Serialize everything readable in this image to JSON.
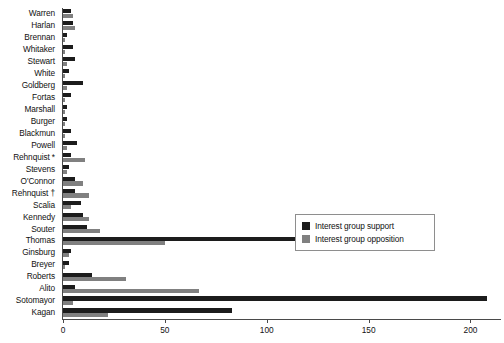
{
  "chart_data": {
    "type": "bar",
    "orientation": "horizontal",
    "title": "",
    "subtitle": "",
    "xlabel": "",
    "ylabel": "",
    "xlim": [
      0,
      215
    ],
    "ylim": null,
    "grid": false,
    "axis_ticks": [
      0,
      50,
      100,
      150,
      200
    ],
    "tick_labels": [
      "0",
      "50",
      "100",
      "150",
      "200"
    ],
    "legend_position": "center-right-inside",
    "categories": [
      "Warren",
      "Harlan",
      "Brennan",
      "Whitaker",
      "Stewart",
      "White",
      "Goldberg",
      "Fortas",
      "Marshall",
      "Burger",
      "Blackmun",
      "Powell",
      "Rehnquist *",
      "Stevens",
      "O'Connor",
      "Rehnquist †",
      "Scalia",
      "Kennedy",
      "Souter",
      "Thomas",
      "Ginsburg",
      "Breyer",
      "Roberts",
      "Alito",
      "Sotomayor",
      "Kagan"
    ],
    "series": [
      {
        "name": "Interest group support",
        "color": "#1c1c1c",
        "values": [
          4,
          5,
          2,
          5,
          6,
          3,
          10,
          4,
          2,
          2,
          4,
          7,
          4,
          3,
          6,
          6,
          9,
          10,
          12,
          120,
          4,
          3,
          14,
          6,
          208,
          83
        ]
      },
      {
        "name": "Interest group opposition",
        "color": "#808080",
        "values": [
          5,
          6,
          1,
          1,
          2,
          1,
          2,
          1,
          1,
          1,
          1,
          2,
          11,
          2,
          10,
          13,
          4,
          13,
          18,
          50,
          3,
          1,
          31,
          67,
          5,
          22
        ]
      }
    ]
  },
  "legend": {
    "items": [
      {
        "label": "Interest group support",
        "swatch": "support"
      },
      {
        "label": "Interest group opposition",
        "swatch": "opposition"
      }
    ]
  }
}
